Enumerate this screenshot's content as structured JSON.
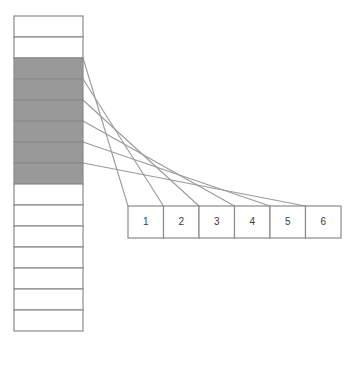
{
  "diagram": {
    "colors": {
      "highlight_fill": "#999999",
      "plain_fill": "#ffffff",
      "border": "#8a8a8a",
      "connector": "#9a9a9a",
      "label_text": "#3a3a3a",
      "background": "#ffffff"
    },
    "column": {
      "name": "vertical-cell-column",
      "x": 14,
      "y": 16,
      "width": 69,
      "cell_height": 21,
      "cell_count": 15,
      "highlighted_indices": [
        2,
        3,
        4,
        5,
        6,
        7
      ],
      "cells": [
        {
          "index": 0,
          "label": "",
          "state": "plain"
        },
        {
          "index": 1,
          "label": "",
          "state": "plain"
        },
        {
          "index": 2,
          "label": "",
          "state": "highlighted"
        },
        {
          "index": 3,
          "label": "",
          "state": "highlighted"
        },
        {
          "index": 4,
          "label": "",
          "state": "highlighted"
        },
        {
          "index": 5,
          "label": "",
          "state": "highlighted"
        },
        {
          "index": 6,
          "label": "",
          "state": "highlighted"
        },
        {
          "index": 7,
          "label": "",
          "state": "highlighted"
        },
        {
          "index": 8,
          "label": "",
          "state": "plain"
        },
        {
          "index": 9,
          "label": "",
          "state": "plain"
        },
        {
          "index": 10,
          "label": "",
          "state": "plain"
        },
        {
          "index": 11,
          "label": "",
          "state": "plain"
        },
        {
          "index": 12,
          "label": "",
          "state": "plain"
        },
        {
          "index": 13,
          "label": "",
          "state": "plain"
        },
        {
          "index": 14,
          "label": "",
          "state": "plain"
        }
      ]
    },
    "row": {
      "name": "horizontal-numbered-row",
      "x": 128,
      "y": 206,
      "box_width": 35.5,
      "box_height": 32,
      "boxes": [
        {
          "index": 0,
          "label": "1"
        },
        {
          "index": 1,
          "label": "2"
        },
        {
          "index": 2,
          "label": "3"
        },
        {
          "index": 3,
          "label": "4"
        },
        {
          "index": 4,
          "label": "5"
        },
        {
          "index": 5,
          "label": "6"
        }
      ]
    },
    "connectors": [
      {
        "name": "connector-1",
        "from_cell": 2,
        "to_box": 0,
        "x1": 83,
        "y1": 58,
        "x2": 128,
        "y2": 206
      },
      {
        "name": "connector-2",
        "from_cell": 3,
        "to_box": 1,
        "x1": 83,
        "y1": 79,
        "x2": 163.5,
        "y2": 206
      },
      {
        "name": "connector-3",
        "from_cell": 4,
        "to_box": 2,
        "x1": 83,
        "y1": 100,
        "x2": 199,
        "y2": 206
      },
      {
        "name": "connector-4",
        "from_cell": 5,
        "to_box": 3,
        "x1": 83,
        "y1": 121,
        "x2": 234.5,
        "y2": 206
      },
      {
        "name": "connector-5",
        "from_cell": 6,
        "to_box": 4,
        "x1": 83,
        "y1": 142,
        "x2": 270,
        "y2": 206
      },
      {
        "name": "connector-6",
        "from_cell": 7,
        "to_box": 5,
        "x1": 83,
        "y1": 163,
        "x2": 305.5,
        "y2": 206
      }
    ]
  }
}
